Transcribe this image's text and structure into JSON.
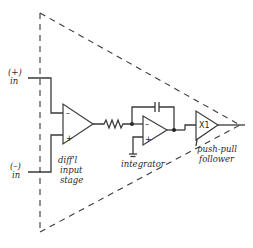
{
  "diagram": {
    "type": "op-amp block diagram",
    "inputs": {
      "plus": {
        "top": "(+)",
        "bottom": "in"
      },
      "minus": {
        "top": "(–)",
        "bottom": "in"
      }
    },
    "stages": [
      {
        "id": "diff",
        "label_lines": [
          "diff'l",
          "input",
          "stage"
        ],
        "pins": {
          "minus": "–",
          "plus": "+"
        }
      },
      {
        "id": "integrator",
        "label_lines": [
          "integrator"
        ],
        "pins": {
          "minus": "–",
          "plus": "+"
        }
      },
      {
        "id": "follower",
        "label_lines": [
          "push-pull",
          "follower"
        ],
        "gain": "X1"
      }
    ],
    "components": [
      "resistor",
      "capacitor",
      "ground"
    ],
    "outline": "dashed triangle"
  }
}
